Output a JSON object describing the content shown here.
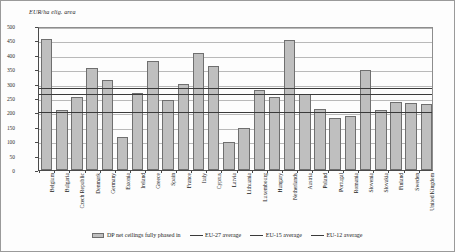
{
  "chart_data": {
    "type": "bar",
    "title": "",
    "xlabel": "",
    "ylabel": "EUR/ha elig. area",
    "ylim": [
      0,
      500
    ],
    "ytick_step": 50,
    "yticks": [
      0,
      50,
      100,
      150,
      200,
      250,
      300,
      350,
      400,
      450,
      500
    ],
    "grid": true,
    "legend_position": "bottom",
    "categories": [
      "Belgium",
      "Bulgaria",
      "Czech Republic",
      "Denmark",
      "Germany",
      "Estonia",
      "Ireland",
      "Greece",
      "Spain",
      "France",
      "Italy",
      "Cyprus",
      "Latvia",
      "Lithuania",
      "Luxembourg",
      "Hungary",
      "Netherlands",
      "Austria",
      "Poland",
      "Portugal",
      "Romania",
      "Slovenia",
      "Slovakia",
      "Finland",
      "Sweden",
      "United Kingdom"
    ],
    "series": [
      {
        "name": "DP net ceilings fully phased in",
        "kind": "bar",
        "color": "#bfbfbf",
        "values": [
          462,
          212,
          258,
          358,
          318,
          118,
          270,
          385,
          248,
          303,
          413,
          365,
          97,
          149,
          283,
          258,
          458,
          266,
          215,
          183,
          191,
          352,
          210,
          240,
          235,
          231
        ]
      },
      {
        "name": "EU-27 average",
        "kind": "line",
        "color": "#3a3a3a",
        "value": 290
      },
      {
        "name": "EU-15 average",
        "kind": "line",
        "color": "#3a3a3a",
        "value": 272
      },
      {
        "name": "EU-12 average",
        "kind": "line",
        "color": "#3a3a3a",
        "value": 208
      }
    ]
  },
  "legend": {
    "items": [
      {
        "label": "DP net ceilings fully phased in",
        "marker": "bar"
      },
      {
        "label": "EU-27 average",
        "marker": "line"
      },
      {
        "label": "EU-15 average",
        "marker": "line"
      },
      {
        "label": "EU-12 average",
        "marker": "line"
      }
    ]
  }
}
